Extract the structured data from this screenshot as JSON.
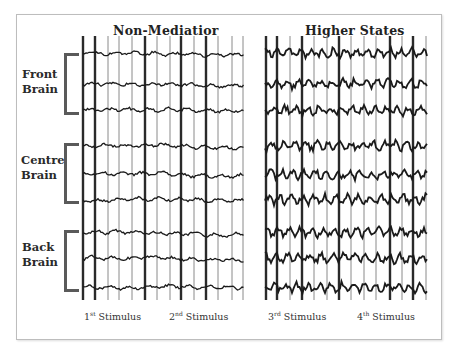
{
  "panels": [
    {
      "title": "Non-Mediatior",
      "x0": 83,
      "x1": 244,
      "seed": 3,
      "amp": 2.2,
      "freq": 0.9
    },
    {
      "title": "Higher States",
      "x0": 265,
      "x1": 428,
      "seed": 11,
      "amp": 5.5,
      "freq": 1.6
    }
  ],
  "regions": [
    {
      "line1": "Front",
      "line2": "Brain"
    },
    {
      "line1": "Centre",
      "line2": "Brain"
    },
    {
      "line1": "Back",
      "line2": "Brain"
    }
  ],
  "stimuli": [
    {
      "num": "1",
      "sup": "st",
      "label": "Stimulus"
    },
    {
      "num": "2",
      "sup": "nd",
      "label": "Stimulus"
    },
    {
      "num": "3",
      "sup": "rd",
      "label": "Stimulus"
    },
    {
      "num": "4",
      "sup": "th",
      "label": "Stimulus"
    }
  ],
  "traces_y": [
    53,
    84,
    110,
    146,
    174,
    200,
    232,
    258,
    287
  ],
  "left_lines": [
    83,
    95,
    108,
    119,
    132,
    145,
    157,
    170,
    181,
    194,
    206,
    218,
    232,
    243
  ],
  "right_lines": [
    266,
    277,
    290,
    302,
    314,
    327,
    339,
    351,
    364,
    376,
    390,
    402,
    413,
    426
  ],
  "colors": {
    "trace": "#1a1a1a",
    "grid": "#8a8a8a",
    "bracket": "#5a5a5a"
  }
}
